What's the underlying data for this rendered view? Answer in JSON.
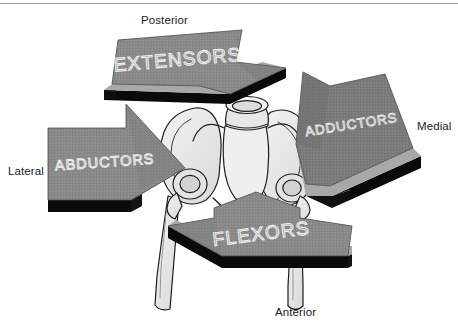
{
  "orientation_labels": [
    {
      "id": "posterior",
      "text": "Posterior"
    },
    {
      "id": "lateral",
      "text": "Lateral"
    },
    {
      "id": "medial",
      "text": "Medial"
    },
    {
      "id": "anterior",
      "text": "Anterior"
    }
  ],
  "arrows": [
    {
      "id": "extensors",
      "label": "EXTENSORS",
      "direction": "posterior",
      "position": "top"
    },
    {
      "id": "abductors",
      "label": "ABDUCTORS",
      "direction": "lateral",
      "position": "left"
    },
    {
      "id": "adductors",
      "label": "ADDUCTORS",
      "direction": "medial",
      "position": "right"
    },
    {
      "id": "flexors",
      "label": "FLEXORS",
      "direction": "anterior",
      "position": "bottom"
    }
  ],
  "anatomy": {
    "parts": [
      "sacrum",
      "lumbar-vertebra",
      "left-ilium",
      "right-ilium",
      "left-acetabulum",
      "right-acetabulum",
      "left-femur",
      "right-femur",
      "pubis"
    ]
  },
  "colors": {
    "arrow_face": "#8a8a8a",
    "arrow_face_dark": "#767676",
    "arrow_bevel": "#a6a6a6",
    "arrow_edge": "#0a0a0a",
    "arrow_text": "#e8e8e8",
    "bone_fill": "#ececec",
    "bone_fill_shade": "#d8d8d8",
    "bone_stroke": "#1d1d1d",
    "label_text": "#1a1a1a",
    "rule": "#9a9a9a",
    "background": "#ffffff"
  }
}
